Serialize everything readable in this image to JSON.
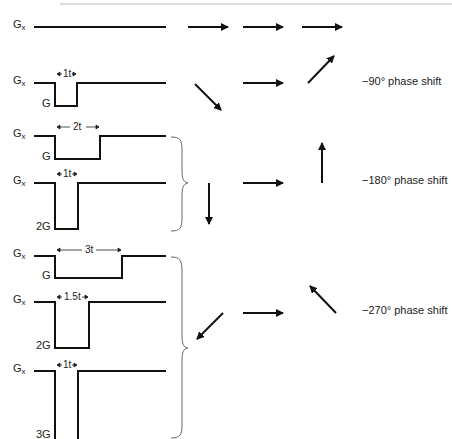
{
  "header": {
    "rule_color": "#bbbbbb"
  },
  "gradient_label": "G",
  "gradient_subscript": "x",
  "rows": [
    {
      "id": "row1",
      "amplitude": "",
      "duration": ""
    },
    {
      "id": "row2",
      "amplitude": "G",
      "duration": "1t"
    },
    {
      "id": "row3",
      "amplitude": "G",
      "duration": "2t"
    },
    {
      "id": "row4",
      "amplitude": "2G",
      "duration": "1t"
    },
    {
      "id": "row5",
      "amplitude": "G",
      "duration": "3t"
    },
    {
      "id": "row6",
      "amplitude": "2G",
      "duration": "1.5t"
    },
    {
      "id": "row7",
      "amplitude": "3G",
      "duration": "1t"
    }
  ],
  "phase_labels": [
    {
      "text": "−90° phase shift"
    },
    {
      "text": "−180° phase shift"
    },
    {
      "text": "−270° phase shift"
    }
  ],
  "colors": {
    "line": "#111111",
    "brace": "#666666",
    "text": "#222222"
  }
}
